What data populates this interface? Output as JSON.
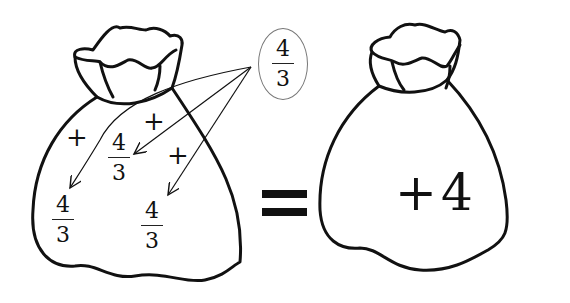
{
  "left_bag": {
    "terms": [
      {
        "sign": "+",
        "numerator": "4",
        "denominator": "3"
      },
      {
        "sign": "+",
        "numerator": "4",
        "denominator": "3"
      },
      {
        "sign": "+",
        "numerator": "4",
        "denominator": "3"
      }
    ]
  },
  "source_bubble": {
    "numerator": "4",
    "denominator": "3"
  },
  "equals_sign": "=",
  "right_bag": {
    "sign": "+",
    "value": "4"
  },
  "colors": {
    "stroke": "#111111",
    "bubble_border": "#777777",
    "background": "#ffffff"
  }
}
